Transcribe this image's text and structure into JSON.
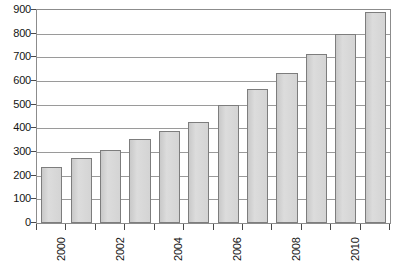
{
  "chart_data": {
    "type": "bar",
    "title": "",
    "subtitle": "",
    "xlabel": "",
    "ylabel": "",
    "categories": [
      "2000",
      "2001",
      "2002",
      "2003",
      "2004",
      "2005",
      "2006",
      "2007",
      "2008",
      "2009",
      "2010",
      "2011"
    ],
    "values": [
      235,
      275,
      310,
      355,
      390,
      425,
      500,
      565,
      635,
      715,
      800,
      890
    ],
    "ylim": [
      0,
      900
    ],
    "ytick_labels": [
      "0",
      "100",
      "200",
      "300",
      "400",
      "500",
      "600",
      "700",
      "800",
      "900"
    ],
    "ytick_values": [
      0,
      100,
      200,
      300,
      400,
      500,
      600,
      700,
      800,
      900
    ],
    "xtick_labels_visible": [
      "2000",
      "2002",
      "2004",
      "2006",
      "2008",
      "2010"
    ],
    "xtick_label_rotation": -90,
    "grid": {
      "horizontal": true,
      "vertical": false
    },
    "legend": {
      "visible": false,
      "position": "none"
    },
    "annotations": [],
    "colors": {
      "bar_fill": "#d2d2d2",
      "bar_border": "#7d7d7d",
      "gridline": "#9a9a9a",
      "axis": "#8c8c8c",
      "text": "#141414",
      "background": "#ffffff"
    }
  }
}
